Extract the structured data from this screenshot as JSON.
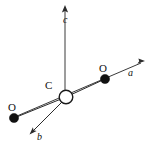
{
  "figure": {
    "type": "crystal-axes-molecular-diagram",
    "width": 154,
    "height": 148,
    "background_color": "#ffffff",
    "line_color": "#2b2b2b",
    "atom_fill_color": "#111111",
    "central_atom_fill_color": "#ffffff"
  },
  "axes": [
    {
      "id": "a",
      "label": "a",
      "label_x": 128,
      "label_y": 69,
      "direction": "up-right",
      "origin_x": 66,
      "origin_y": 97,
      "tip_x": 143,
      "tip_y": 62,
      "arrow_angle_deg": -24.4
    },
    {
      "id": "b",
      "label": "b",
      "label_x": 37,
      "label_y": 133,
      "direction": "down-left",
      "origin_x": 64,
      "origin_y": 101,
      "tip_x": 31,
      "tip_y": 133,
      "arrow_angle_deg": 135.8
    },
    {
      "id": "c",
      "label": "c",
      "label_x": 63,
      "label_y": 15,
      "direction": "up",
      "origin_x": 65,
      "origin_y": 90,
      "tip_x": 65,
      "tip_y": 7,
      "arrow_angle_deg": -90
    }
  ],
  "atoms": [
    {
      "id": "C-center",
      "element": "C",
      "style": "open-circle",
      "cx": 66,
      "cy": 97,
      "r": 7,
      "label": "C",
      "label_x": 45,
      "label_y": 81
    },
    {
      "id": "O-right",
      "element": "O",
      "style": "filled-circle",
      "cx": 105,
      "cy": 79,
      "r": 4.6,
      "label": "O",
      "label_x": 99,
      "label_y": 64
    },
    {
      "id": "O-left",
      "element": "O",
      "style": "filled-circle",
      "cx": 14,
      "cy": 118,
      "r": 4.6,
      "label": "O",
      "label_x": 8,
      "label_y": 103
    }
  ],
  "bonds": [
    {
      "id": "bond-C-O-right",
      "from": "C-center",
      "to": "O-right",
      "x1": 66,
      "y1": 97,
      "x2": 105,
      "y2": 79
    },
    {
      "id": "bond-C-O-left",
      "from": "C-center",
      "to": "O-left",
      "x1": 66,
      "y1": 97,
      "x2": 14,
      "y2": 118
    }
  ]
}
